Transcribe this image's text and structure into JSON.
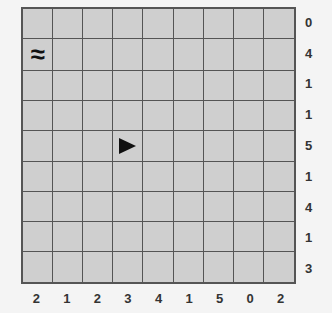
{
  "puzzle": {
    "rows": 9,
    "cols": 9,
    "row_clues": [
      "0",
      "4",
      "1",
      "1",
      "5",
      "1",
      "4",
      "1",
      "3"
    ],
    "col_clues": [
      "2",
      "1",
      "2",
      "3",
      "4",
      "1",
      "5",
      "0",
      "2"
    ],
    "markers": [
      {
        "row": 1,
        "col": 0,
        "icon": "wave-icon",
        "glyph": "≈"
      },
      {
        "row": 4,
        "col": 3,
        "icon": "ship-right-triangle-icon",
        "glyph": "▶"
      }
    ]
  },
  "colors": {
    "cell": "#cfcfcf",
    "grid_line": "#555555",
    "background": "#f4f4f4",
    "clue_text": "#333333"
  }
}
